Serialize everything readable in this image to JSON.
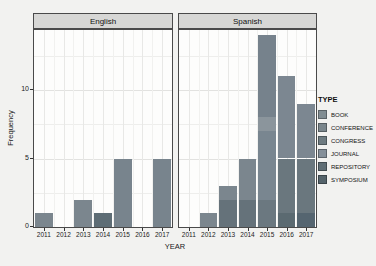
{
  "figure": {
    "x_axis_title": "YEAR",
    "y_axis_title": "Frequency",
    "y_tick_labels": [
      "0",
      "5",
      "10"
    ],
    "facet_labels": [
      "English",
      "Spanish"
    ],
    "years": [
      "2011",
      "2012",
      "2013",
      "2014",
      "2015",
      "2016",
      "2017"
    ]
  },
  "legend": {
    "title": "TYPE",
    "entries": [
      {
        "label": "BOOK",
        "color": "#818d92"
      },
      {
        "label": "CONFERENCE",
        "color": "#7a868c"
      },
      {
        "label": "CONGRESS",
        "color": "#6e7b81"
      },
      {
        "label": "JOURNAL",
        "color": "#85909a"
      },
      {
        "label": "REPOSITORY",
        "color": "#5f6e75"
      },
      {
        "label": "SYMPOSIUM",
        "color": "#55646b"
      }
    ]
  },
  "chart_data": {
    "type": "bar",
    "stacked": true,
    "title": "",
    "xlabel": "YEAR",
    "ylabel": "Frequency",
    "categories": [
      "2011",
      "2012",
      "2013",
      "2014",
      "2015",
      "2016",
      "2017"
    ],
    "ylim": [
      0,
      14.4
    ],
    "y_major_ticks": [
      0,
      5,
      10
    ],
    "y_minor_ticks": [
      2.5,
      7.5,
      12.5
    ],
    "grid": true,
    "legend_position": "right",
    "facets": [
      {
        "label": "English",
        "totals": [
          1,
          0,
          2,
          1,
          5,
          0,
          5
        ],
        "bars": [
          {
            "year": "2011",
            "segments": [
              {
                "value": 1,
                "color": "#7b868e"
              }
            ]
          },
          {
            "year": "2013",
            "segments": [
              {
                "value": 2,
                "color": "#7b868e"
              }
            ]
          },
          {
            "year": "2014",
            "segments": [
              {
                "value": 1,
                "color": "#5e6d75"
              }
            ]
          },
          {
            "year": "2015",
            "segments": [
              {
                "value": 5,
                "color": "#78848d"
              }
            ]
          },
          {
            "year": "2017",
            "segments": [
              {
                "value": 5,
                "color": "#78848d"
              }
            ]
          }
        ]
      },
      {
        "label": "Spanish",
        "totals": [
          0,
          1,
          3,
          5,
          14,
          11,
          9
        ],
        "bars": [
          {
            "year": "2012",
            "segments": [
              {
                "value": 1,
                "color": "#7b868e"
              }
            ]
          },
          {
            "year": "2013",
            "segments": [
              {
                "value": 2,
                "color": "#65727a"
              },
              {
                "value": 1,
                "color": "#7b868e"
              }
            ]
          },
          {
            "year": "2014",
            "segments": [
              {
                "value": 2,
                "color": "#65727a"
              },
              {
                "value": 3,
                "color": "#7b868e"
              }
            ]
          },
          {
            "year": "2015",
            "segments": [
              {
                "value": 2,
                "color": "#6b7880"
              },
              {
                "value": 5,
                "color": "#798690"
              },
              {
                "value": 1,
                "color": "#8b959c"
              },
              {
                "value": 6,
                "color": "#76828c"
              }
            ]
          },
          {
            "year": "2016",
            "segments": [
              {
                "value": 1,
                "color": "#5b6a71"
              },
              {
                "value": 4,
                "color": "#6a777e"
              },
              {
                "value": 6,
                "color": "#7c8791"
              }
            ]
          },
          {
            "year": "2017",
            "segments": [
              {
                "value": 1,
                "color": "#556570"
              },
              {
                "value": 4,
                "color": "#6a777e"
              },
              {
                "value": 4,
                "color": "#7c8791"
              }
            ]
          }
        ]
      }
    ]
  },
  "colors": {
    "paper": "#f2f2f0",
    "panel_bg": "#fdfdfc",
    "strip_bg": "#d7d7d5",
    "border": "#4a4a4a",
    "grid_major": "#e2e2e0",
    "grid_minor": "#eeeeec",
    "text": "#1c1c1c"
  }
}
